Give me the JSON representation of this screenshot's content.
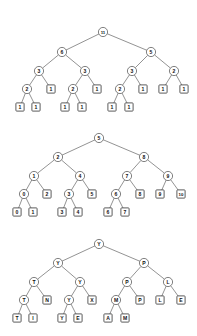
{
  "page": {
    "background_color": "#ffffff",
    "stroke_color": "#4a4a4a",
    "text_color": "#111111",
    "width": 197,
    "height": 336,
    "figure_count": 3
  },
  "figures": [
    {
      "id": "figure-1",
      "name": "binary-tree-subtree-sizes",
      "description": "Binary tree with subtree node counts",
      "root_value": "11",
      "nodes": [
        {
          "id": "t1n0",
          "label": "11",
          "shape": "circle",
          "x": 103,
          "y": 32,
          "level": 0
        },
        {
          "id": "t1n1",
          "label": "6",
          "shape": "circle",
          "x": 62,
          "y": 52,
          "level": 1
        },
        {
          "id": "t1n2",
          "label": "5",
          "shape": "circle",
          "x": 151,
          "y": 52,
          "level": 1
        },
        {
          "id": "t1n3",
          "label": "3",
          "shape": "circle",
          "x": 39,
          "y": 71,
          "level": 2
        },
        {
          "id": "t1n4",
          "label": "3",
          "shape": "circle",
          "x": 85,
          "y": 71,
          "level": 2
        },
        {
          "id": "t1n5",
          "label": "3",
          "shape": "circle",
          "x": 132,
          "y": 71,
          "level": 2
        },
        {
          "id": "t1n6",
          "label": "2",
          "shape": "circle",
          "x": 174,
          "y": 71,
          "level": 2
        },
        {
          "id": "t1n7",
          "label": "2",
          "shape": "circle",
          "x": 27,
          "y": 89,
          "level": 3
        },
        {
          "id": "t1n8",
          "label": "1",
          "shape": "square",
          "x": 51,
          "y": 89,
          "level": 3
        },
        {
          "id": "t1n9",
          "label": "2",
          "shape": "circle",
          "x": 73,
          "y": 89,
          "level": 3
        },
        {
          "id": "t1n10",
          "label": "1",
          "shape": "square",
          "x": 97,
          "y": 89,
          "level": 3
        },
        {
          "id": "t1n11",
          "label": "2",
          "shape": "circle",
          "x": 120,
          "y": 89,
          "level": 3
        },
        {
          "id": "t1n12",
          "label": "1",
          "shape": "square",
          "x": 143,
          "y": 89,
          "level": 3
        },
        {
          "id": "t1n13",
          "label": "1",
          "shape": "square",
          "x": 163,
          "y": 89,
          "level": 3
        },
        {
          "id": "t1n14",
          "label": "1",
          "shape": "square",
          "x": 184,
          "y": 89,
          "level": 3
        },
        {
          "id": "t1n15",
          "label": "1",
          "shape": "square",
          "x": 20,
          "y": 107,
          "level": 4
        },
        {
          "id": "t1n16",
          "label": "1",
          "shape": "square",
          "x": 36,
          "y": 107,
          "level": 4
        },
        {
          "id": "t1n17",
          "label": "1",
          "shape": "square",
          "x": 65,
          "y": 107,
          "level": 4
        },
        {
          "id": "t1n18",
          "label": "1",
          "shape": "square",
          "x": 82,
          "y": 107,
          "level": 4
        },
        {
          "id": "t1n19",
          "label": "1",
          "shape": "square",
          "x": 112,
          "y": 107,
          "level": 4
        },
        {
          "id": "t1n20",
          "label": "1",
          "shape": "square",
          "x": 129,
          "y": 107,
          "level": 4
        }
      ],
      "edges": [
        [
          "t1n0",
          "t1n1"
        ],
        [
          "t1n0",
          "t1n2"
        ],
        [
          "t1n1",
          "t1n3"
        ],
        [
          "t1n1",
          "t1n4"
        ],
        [
          "t1n2",
          "t1n5"
        ],
        [
          "t1n2",
          "t1n6"
        ],
        [
          "t1n3",
          "t1n7"
        ],
        [
          "t1n3",
          "t1n8"
        ],
        [
          "t1n4",
          "t1n9"
        ],
        [
          "t1n4",
          "t1n10"
        ],
        [
          "t1n5",
          "t1n11"
        ],
        [
          "t1n5",
          "t1n12"
        ],
        [
          "t1n6",
          "t1n13"
        ],
        [
          "t1n6",
          "t1n14"
        ],
        [
          "t1n7",
          "t1n15"
        ],
        [
          "t1n7",
          "t1n16"
        ],
        [
          "t1n9",
          "t1n17"
        ],
        [
          "t1n9",
          "t1n18"
        ],
        [
          "t1n11",
          "t1n19"
        ],
        [
          "t1n11",
          "t1n20"
        ]
      ]
    },
    {
      "id": "figure-2",
      "name": "binary-tree-inorder-ranks",
      "description": "Binary tree with in-order index values",
      "root_value": "5",
      "nodes": [
        {
          "id": "t2n0",
          "label": "5",
          "shape": "circle",
          "x": 99,
          "y": 18,
          "level": 0
        },
        {
          "id": "t2n1",
          "label": "2",
          "shape": "circle",
          "x": 58,
          "y": 37,
          "level": 1
        },
        {
          "id": "t2n2",
          "label": "8",
          "shape": "circle",
          "x": 144,
          "y": 37,
          "level": 1
        },
        {
          "id": "t2n3",
          "label": "1",
          "shape": "circle",
          "x": 34,
          "y": 56,
          "level": 2
        },
        {
          "id": "t2n4",
          "label": "4",
          "shape": "circle",
          "x": 80,
          "y": 56,
          "level": 2
        },
        {
          "id": "t2n5",
          "label": "7",
          "shape": "circle",
          "x": 127,
          "y": 56,
          "level": 2
        },
        {
          "id": "t2n6",
          "label": "9",
          "shape": "circle",
          "x": 168,
          "y": 56,
          "level": 2
        },
        {
          "id": "t2n7",
          "label": "0",
          "shape": "circle",
          "x": 24,
          "y": 74,
          "level": 3
        },
        {
          "id": "t2n8",
          "label": "2",
          "shape": "square",
          "x": 47,
          "y": 74,
          "level": 3
        },
        {
          "id": "t2n9",
          "label": "3",
          "shape": "circle",
          "x": 69,
          "y": 74,
          "level": 3
        },
        {
          "id": "t2n10",
          "label": "5",
          "shape": "square",
          "x": 92,
          "y": 74,
          "level": 3
        },
        {
          "id": "t2n11",
          "label": "6",
          "shape": "circle",
          "x": 116,
          "y": 74,
          "level": 3
        },
        {
          "id": "t2n12",
          "label": "8",
          "shape": "square",
          "x": 140,
          "y": 74,
          "level": 3
        },
        {
          "id": "t2n13",
          "label": "9",
          "shape": "square",
          "x": 160,
          "y": 74,
          "level": 3
        },
        {
          "id": "t2n14",
          "label": "10",
          "shape": "square",
          "x": 181,
          "y": 74,
          "level": 3
        },
        {
          "id": "t2n15",
          "label": "0",
          "shape": "square",
          "x": 17,
          "y": 92,
          "level": 4
        },
        {
          "id": "t2n16",
          "label": "1",
          "shape": "square",
          "x": 33,
          "y": 92,
          "level": 4
        },
        {
          "id": "t2n17",
          "label": "3",
          "shape": "square",
          "x": 62,
          "y": 92,
          "level": 4
        },
        {
          "id": "t2n18",
          "label": "4",
          "shape": "square",
          "x": 78,
          "y": 92,
          "level": 4
        },
        {
          "id": "t2n19",
          "label": "6",
          "shape": "square",
          "x": 108,
          "y": 92,
          "level": 4
        },
        {
          "id": "t2n20",
          "label": "7",
          "shape": "square",
          "x": 125,
          "y": 92,
          "level": 4
        }
      ],
      "edges": [
        [
          "t2n0",
          "t2n1"
        ],
        [
          "t2n0",
          "t2n2"
        ],
        [
          "t2n1",
          "t2n3"
        ],
        [
          "t2n1",
          "t2n4"
        ],
        [
          "t2n2",
          "t2n5"
        ],
        [
          "t2n2",
          "t2n6"
        ],
        [
          "t2n3",
          "t2n7"
        ],
        [
          "t2n3",
          "t2n8"
        ],
        [
          "t2n4",
          "t2n9"
        ],
        [
          "t2n4",
          "t2n10"
        ],
        [
          "t2n5",
          "t2n11"
        ],
        [
          "t2n5",
          "t2n12"
        ],
        [
          "t2n6",
          "t2n13"
        ],
        [
          "t2n6",
          "t2n14"
        ],
        [
          "t2n7",
          "t2n15"
        ],
        [
          "t2n7",
          "t2n16"
        ],
        [
          "t2n9",
          "t2n17"
        ],
        [
          "t2n9",
          "t2n18"
        ],
        [
          "t2n11",
          "t2n19"
        ],
        [
          "t2n11",
          "t2n20"
        ]
      ]
    },
    {
      "id": "figure-3",
      "name": "binary-tree-letter-keys",
      "description": "Binary tree with letter keys",
      "root_value": "Y",
      "nodes": [
        {
          "id": "t3n0",
          "label": "Y",
          "shape": "circle",
          "x": 99,
          "y": 14,
          "level": 0
        },
        {
          "id": "t3n1",
          "label": "Y",
          "shape": "circle",
          "x": 58,
          "y": 33,
          "level": 1
        },
        {
          "id": "t3n2",
          "label": "P",
          "shape": "circle",
          "x": 144,
          "y": 33,
          "level": 1
        },
        {
          "id": "t3n3",
          "label": "T",
          "shape": "circle",
          "x": 34,
          "y": 52,
          "level": 2
        },
        {
          "id": "t3n4",
          "label": "Y",
          "shape": "circle",
          "x": 80,
          "y": 52,
          "level": 2
        },
        {
          "id": "t3n5",
          "label": "P",
          "shape": "circle",
          "x": 127,
          "y": 52,
          "level": 2
        },
        {
          "id": "t3n6",
          "label": "L",
          "shape": "circle",
          "x": 168,
          "y": 52,
          "level": 2
        },
        {
          "id": "t3n7",
          "label": "T",
          "shape": "circle",
          "x": 24,
          "y": 70,
          "level": 3
        },
        {
          "id": "t3n8",
          "label": "N",
          "shape": "square",
          "x": 47,
          "y": 70,
          "level": 3
        },
        {
          "id": "t3n9",
          "label": "Y",
          "shape": "circle",
          "x": 69,
          "y": 70,
          "level": 3
        },
        {
          "id": "t3n10",
          "label": "X",
          "shape": "square",
          "x": 92,
          "y": 70,
          "level": 3
        },
        {
          "id": "t3n11",
          "label": "M",
          "shape": "circle",
          "x": 116,
          "y": 70,
          "level": 3
        },
        {
          "id": "t3n12",
          "label": "P",
          "shape": "square",
          "x": 140,
          "y": 70,
          "level": 3
        },
        {
          "id": "t3n13",
          "label": "L",
          "shape": "square",
          "x": 160,
          "y": 70,
          "level": 3
        },
        {
          "id": "t3n14",
          "label": "E",
          "shape": "square",
          "x": 181,
          "y": 70,
          "level": 3
        },
        {
          "id": "t3n15",
          "label": "T",
          "shape": "square",
          "x": 17,
          "y": 88,
          "level": 4
        },
        {
          "id": "t3n16",
          "label": "I",
          "shape": "square",
          "x": 33,
          "y": 88,
          "level": 4
        },
        {
          "id": "t3n17",
          "label": "Y",
          "shape": "square",
          "x": 62,
          "y": 88,
          "level": 4
        },
        {
          "id": "t3n18",
          "label": "E",
          "shape": "square",
          "x": 78,
          "y": 88,
          "level": 4
        },
        {
          "id": "t3n19",
          "label": "A",
          "shape": "square",
          "x": 108,
          "y": 88,
          "level": 4
        },
        {
          "id": "t3n20",
          "label": "M",
          "shape": "square",
          "x": 125,
          "y": 88,
          "level": 4
        }
      ],
      "edges": [
        [
          "t3n0",
          "t3n1"
        ],
        [
          "t3n0",
          "t3n2"
        ],
        [
          "t3n1",
          "t3n3"
        ],
        [
          "t3n1",
          "t3n4"
        ],
        [
          "t3n2",
          "t3n5"
        ],
        [
          "t3n2",
          "t3n6"
        ],
        [
          "t3n3",
          "t3n7"
        ],
        [
          "t3n3",
          "t3n8"
        ],
        [
          "t3n4",
          "t3n9"
        ],
        [
          "t3n4",
          "t3n10"
        ],
        [
          "t3n5",
          "t3n11"
        ],
        [
          "t3n5",
          "t3n12"
        ],
        [
          "t3n6",
          "t3n13"
        ],
        [
          "t3n6",
          "t3n14"
        ],
        [
          "t3n7",
          "t3n15"
        ],
        [
          "t3n7",
          "t3n16"
        ],
        [
          "t3n9",
          "t3n17"
        ],
        [
          "t3n9",
          "t3n18"
        ],
        [
          "t3n11",
          "t3n19"
        ],
        [
          "t3n11",
          "t3n20"
        ]
      ]
    }
  ],
  "geometry": {
    "circle_radius": 4.6,
    "square_size": 8.2,
    "square_radius": 0.8
  }
}
